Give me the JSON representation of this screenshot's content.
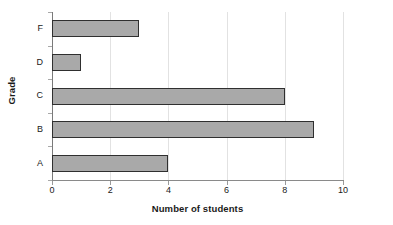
{
  "chart_data": {
    "type": "bar",
    "orientation": "horizontal",
    "title": "",
    "xlabel": "Number of students",
    "ylabel": "Grade",
    "categories": [
      "A",
      "B",
      "C",
      "D",
      "F"
    ],
    "values": [
      4,
      9,
      8,
      1,
      3
    ],
    "xlim": [
      0,
      10
    ],
    "xticks": [
      0,
      2,
      4,
      6,
      8,
      10
    ],
    "xtick_labels": [
      "0",
      "2",
      "4",
      "6",
      "8",
      "10"
    ],
    "grid": true,
    "legend": null,
    "series": [
      {
        "name": "Number of students",
        "values": [
          4,
          9,
          8,
          1,
          3
        ]
      }
    ],
    "colors": {
      "bar_fill": "#a9a9a9",
      "bar_border": "#2f2f2f",
      "axis": "#8a8a8a",
      "grid": "#e2e2e2",
      "text": "#1a1a1a",
      "background": "#ffffff"
    }
  }
}
